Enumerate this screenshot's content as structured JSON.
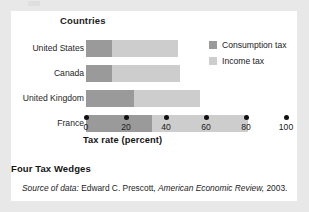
{
  "figure": {
    "caption": "Four Tax Wedges",
    "source_prefix": "Source of data:",
    "source_text": "Edward C. Prescott,",
    "source_publication": "American Economic Review,",
    "source_year": "2003."
  },
  "chart_data": {
    "type": "bar",
    "orientation": "horizontal",
    "stacked": true,
    "title": "",
    "category_axis_title": "Countries",
    "categories": [
      "United States",
      "Canada",
      "United Kingdom",
      "France"
    ],
    "series": [
      {
        "name": "Consumption tax",
        "color": "#9a9a9a",
        "values": [
          13,
          13,
          24,
          33
        ]
      },
      {
        "name": "Income tax",
        "color": "#cdcdcd",
        "values": [
          33,
          34,
          33,
          48
        ]
      }
    ],
    "totals": [
      46,
      47,
      57,
      81
    ],
    "xlabel": "Tax rate (percent)",
    "ylabel": "Countries",
    "xlim": [
      0,
      100
    ],
    "xticks": [
      0,
      20,
      40,
      60,
      80,
      100
    ],
    "xtick_labels": [
      "0",
      "20",
      "40",
      "60",
      "80",
      "100"
    ],
    "tick_marker": "dot",
    "grid": false,
    "legend_position": "top-right"
  },
  "colors": {
    "consumption_tax": "#9a9a9a",
    "income_tax": "#cdcdcd",
    "page_background": "#e8e8e8",
    "panel_background": "#ffffff",
    "text": "#1c1c1c"
  }
}
